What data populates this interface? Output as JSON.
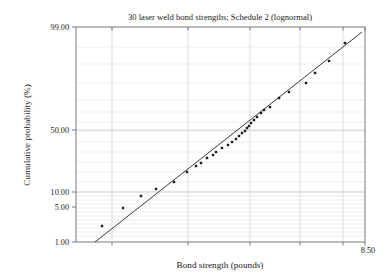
{
  "chart_data": {
    "type": "scatter",
    "title": "30 laser weld bond strengths; Schedule 2 (lognormal)",
    "xlabel": "Bond strength (pounds)",
    "ylabel": "Cumulative probability (%)",
    "x_axis": {
      "scale": "log",
      "tick_labels": [
        "8.50"
      ],
      "max_label": "8.50",
      "gridlines_x_px": [
        112,
        188,
        250,
        300,
        343
      ],
      "range_px": [
        76,
        365
      ]
    },
    "y_axis": {
      "scale": "normal-probability",
      "tick_labels": [
        "99.00",
        "50.00",
        "10.00",
        "5.00",
        "1.00"
      ],
      "tick_values": [
        99.0,
        50.0,
        10.0,
        5.0,
        1.0
      ],
      "tick_px": [
        27,
        130,
        192,
        207,
        242
      ],
      "range_px": [
        27,
        242
      ],
      "minor_grid_px": [
        47,
        64,
        83,
        100,
        112,
        122,
        131,
        142,
        152,
        162,
        172,
        182,
        192,
        196,
        200,
        204,
        208,
        212,
        216,
        220,
        224,
        228,
        232,
        236
      ],
      "major_grid_px": [
        192,
        130
      ]
    },
    "grid": true,
    "legend": "none",
    "n_points": 30,
    "points_px": [
      [
        102,
        226
      ],
      [
        123,
        208
      ],
      [
        141,
        196
      ],
      [
        156,
        189
      ],
      [
        174,
        182
      ],
      [
        187,
        172
      ],
      [
        196,
        166
      ],
      [
        201,
        163
      ],
      [
        207,
        158
      ],
      [
        213,
        155
      ],
      [
        216,
        152
      ],
      [
        222,
        148
      ],
      [
        228,
        145
      ],
      [
        232,
        142
      ],
      [
        236,
        139
      ],
      [
        239,
        136
      ],
      [
        242,
        133
      ],
      [
        245,
        131
      ],
      [
        247,
        128
      ],
      [
        249,
        126
      ],
      [
        251,
        123
      ],
      [
        254,
        120
      ],
      [
        257,
        117
      ],
      [
        261,
        113
      ],
      [
        264,
        110
      ],
      [
        270,
        107
      ],
      [
        279,
        98
      ],
      [
        289,
        92
      ],
      [
        306,
        83
      ],
      [
        315,
        73
      ],
      [
        329,
        61
      ],
      [
        345,
        43
      ]
    ],
    "fit_line_px": {
      "x1": 95,
      "y1": 242,
      "x2": 362,
      "y2": 32
    },
    "plot_area_px": {
      "left": 76,
      "top": 27,
      "right": 365,
      "bottom": 242
    },
    "title_pos_px": {
      "x": 220,
      "y": 20
    },
    "xlabel_pos_px": {
      "x": 220,
      "y": 268
    },
    "ylabel_pos_px": {
      "x": 30,
      "y": 135
    },
    "xmax_label_pos_px": {
      "x": 368,
      "y": 253
    },
    "colors": {
      "point": "#1c1c1c",
      "line": "#262626",
      "grid_minor": "#d9d9dd",
      "grid_major": "#bdbdc4",
      "frame": "#6b6b72",
      "text": "#1a1a1a",
      "background": "#ffffff"
    }
  }
}
